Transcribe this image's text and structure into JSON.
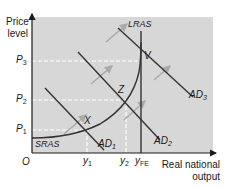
{
  "diagram": {
    "colors": {
      "panel": "#d7d7d7",
      "axis": "#1a1a1a",
      "curve": "#333333",
      "arrow": "#a9a9a9",
      "dashed": "#ffffff"
    },
    "y_axis": {
      "label_line1": "Price",
      "label_line2": "level"
    },
    "x_axis": {
      "label_line1": "Real national",
      "label_line2": "output",
      "origin": "O"
    },
    "price_levels": [
      {
        "id": "P1",
        "base": "P",
        "sub": "1"
      },
      {
        "id": "P2",
        "base": "P",
        "sub": "2"
      },
      {
        "id": "P3",
        "base": "P",
        "sub": "3"
      }
    ],
    "output_levels": [
      {
        "id": "y1",
        "base": "y",
        "sub": "1"
      },
      {
        "id": "y2",
        "base": "y",
        "sub": "2"
      },
      {
        "id": "yFE",
        "base": "y",
        "sub": "FE"
      }
    ],
    "curves": {
      "lras": "LRAS",
      "sras": "SRAS",
      "ad1": {
        "base": "AD",
        "sub": "1"
      },
      "ad2": {
        "base": "AD",
        "sub": "2"
      },
      "ad3": {
        "base": "AD",
        "sub": "3"
      }
    },
    "points": {
      "x": "X",
      "z": "Z",
      "v": "V"
    }
  }
}
